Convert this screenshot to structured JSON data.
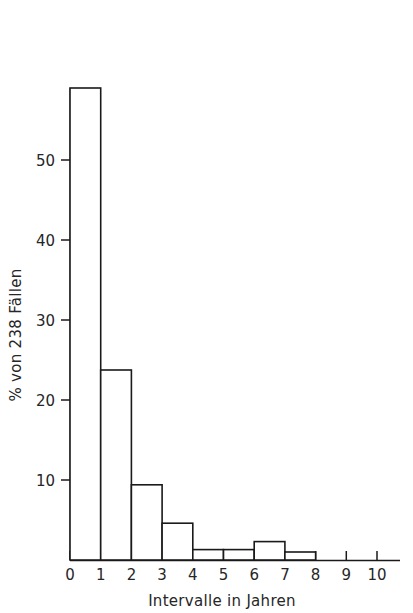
{
  "chart_data": {
    "type": "bar",
    "title": "",
    "subtitle": "",
    "xlabel": "Intervalle in Jahren",
    "ylabel": "% von 238 Fällen",
    "categories": [
      "0-1",
      "1-2",
      "2-3",
      "3-4",
      "4-5",
      "5-6",
      "6-7",
      "7-8",
      "8-9",
      "9-10"
    ],
    "bin_edges": [
      0,
      1,
      2,
      3,
      4,
      5,
      6,
      7,
      8,
      9,
      10
    ],
    "values": [
      59.0,
      23.75,
      9.4,
      4.6,
      1.3,
      1.3,
      2.3,
      1.0,
      0,
      0
    ],
    "x": [
      0,
      1,
      2,
      3,
      4,
      5,
      6,
      7,
      8,
      9,
      10
    ],
    "xtick_labels": [
      "0",
      "1",
      "2",
      "3",
      "4",
      "5",
      "6",
      "7",
      "8",
      "9",
      "10"
    ],
    "ytick_values": [
      10,
      20,
      30,
      40,
      50
    ],
    "ytick_labels": [
      "10",
      "20",
      "30",
      "40",
      "50"
    ],
    "xlim": [
      0,
      10
    ],
    "ylim": [
      0,
      62
    ],
    "grid": false,
    "legend": null,
    "n_total": 238,
    "bar_fill_color": "#ffffff",
    "bar_edge_color": "#1a1a1a",
    "axis_color": "#1a1a1a",
    "background_color": "#ffffff"
  }
}
